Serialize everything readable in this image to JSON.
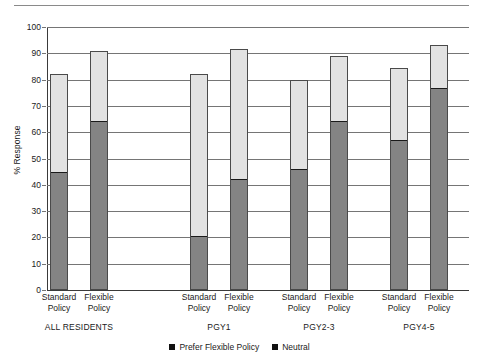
{
  "chart_data": {
    "type": "bar",
    "subtype": "stacked-vertical",
    "title": "",
    "xlabel": "",
    "ylabel": "% Response",
    "ylim": [
      0,
      100
    ],
    "ytick_step": 10,
    "yticks": [
      0,
      10,
      20,
      30,
      40,
      50,
      60,
      70,
      80,
      90,
      100
    ],
    "ytick_labels": [
      "0",
      "10",
      "20",
      "30",
      "40",
      "50",
      "60",
      "70",
      "80",
      "90",
      "100"
    ],
    "grid": true,
    "legend_position": "bottom-center",
    "groups": [
      {
        "name": "ALL RESIDENTS",
        "bars": [
          {
            "label_line1": "Standard",
            "label_line2": "Policy",
            "prefer_flexible_policy": 45,
            "neutral": 37,
            "total": 82
          },
          {
            "label_line1": "Flexible",
            "label_line2": "Policy",
            "prefer_flexible_policy": 64.5,
            "neutral": 26.5,
            "total": 91
          }
        ]
      },
      {
        "name": "PGY1",
        "bars": [
          {
            "label_line1": "Standard",
            "label_line2": "Policy",
            "prefer_flexible_policy": 20.5,
            "neutral": 61.5,
            "total": 82
          },
          {
            "label_line1": "Flexible",
            "label_line2": "Policy",
            "prefer_flexible_policy": 42,
            "neutral": 49.5,
            "total": 91.5
          }
        ]
      },
      {
        "name": "PGY2-3",
        "bars": [
          {
            "label_line1": "Standard",
            "label_line2": "Policy",
            "prefer_flexible_policy": 46,
            "neutral": 34,
            "total": 80
          },
          {
            "label_line1": "Flexible",
            "label_line2": "Policy",
            "prefer_flexible_policy": 64.5,
            "neutral": 24.5,
            "total": 89
          }
        ]
      },
      {
        "name": "PGY4-5",
        "bars": [
          {
            "label_line1": "Standard",
            "label_line2": "Policy",
            "prefer_flexible_policy": 57,
            "neutral": 27.5,
            "total": 84.5
          },
          {
            "label_line1": "Flexible",
            "label_line2": "Policy",
            "prefer_flexible_policy": 77,
            "neutral": 16,
            "total": 93
          }
        ]
      }
    ],
    "series": [
      {
        "name": "Prefer Flexible Policy",
        "color": "#848484",
        "categories": [
          "ALL RESIDENTS Standard Policy",
          "ALL RESIDENTS Flexible Policy",
          "PGY1 Standard Policy",
          "PGY1 Flexible Policy",
          "PGY2-3 Standard Policy",
          "PGY2-3 Flexible Policy",
          "PGY4-5 Standard Policy",
          "PGY4-5 Flexible Policy"
        ],
        "values": [
          45,
          64.5,
          20.5,
          42,
          46,
          64.5,
          57,
          77
        ]
      },
      {
        "name": "Neutral",
        "color": "#e2e2e2",
        "categories": [
          "ALL RESIDENTS Standard Policy",
          "ALL RESIDENTS Flexible Policy",
          "PGY1 Standard Policy",
          "PGY1 Flexible Policy",
          "PGY2-3 Standard Policy",
          "PGY2-3 Flexible Policy",
          "PGY4-5 Standard Policy",
          "PGY4-5 Flexible Policy"
        ],
        "values": [
          37,
          26.5,
          61.5,
          49.5,
          34,
          24.5,
          27.5,
          16
        ]
      }
    ],
    "legend": [
      {
        "label": "Prefer Flexible Policy",
        "color": "#111111"
      },
      {
        "label": "Neutral",
        "color": "#111111"
      }
    ]
  },
  "colors": {
    "neutral_fill": "#e2e2e2",
    "prefer_fill": "#848484",
    "gridline": "#757575",
    "axis": "#3a3a3a",
    "text": "#1a1a1a"
  }
}
